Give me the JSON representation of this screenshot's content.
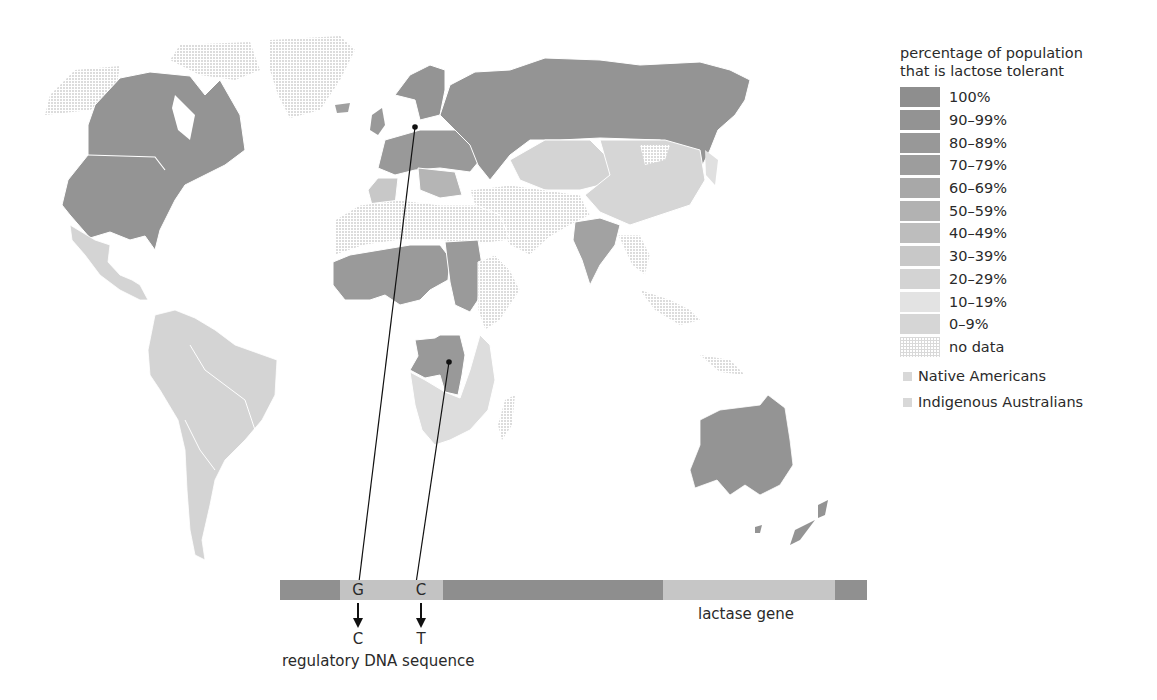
{
  "legend": {
    "title_line1": "percentage of population",
    "title_line2": "that is lactose tolerant",
    "items": [
      {
        "label": "100%",
        "color": "#8e8e8e"
      },
      {
        "label": "90–99%",
        "color": "#939393"
      },
      {
        "label": "80–89%",
        "color": "#989898"
      },
      {
        "label": "70–79%",
        "color": "#9d9d9d"
      },
      {
        "label": "60–69%",
        "color": "#a8a8a8"
      },
      {
        "label": "50–59%",
        "color": "#b2b2b2"
      },
      {
        "label": "40–49%",
        "color": "#bdbdbd"
      },
      {
        "label": "30–39%",
        "color": "#c8c8c8"
      },
      {
        "label": "20–29%",
        "color": "#d3d3d3"
      },
      {
        "label": "10–19%",
        "color": "#e3e3e3"
      },
      {
        "label": "0–9%",
        "color": "#d6d6d6"
      },
      {
        "label": "no data",
        "color": "nodata"
      }
    ],
    "extras": [
      {
        "label": "Native Americans",
        "color": "#d8d8d8"
      },
      {
        "label": "Indigenous Australians",
        "color": "#d8d8d8"
      }
    ]
  },
  "gene": {
    "label": "lactase gene",
    "regulatory_label": "regulatory DNA sequence",
    "mutations": [
      {
        "from": "G",
        "to": "C"
      },
      {
        "from": "C",
        "to": "T"
      }
    ],
    "colors": {
      "dark": "#8f8f8f",
      "light": "#c2c2c2"
    }
  },
  "map": {
    "colors": {
      "high": "#939393",
      "low": "#d4d4d4",
      "lowest": "#e0e0e0",
      "border": "#ffffff"
    },
    "pointers": [
      {
        "region": "Scandinavia",
        "mutation": "G→C"
      },
      {
        "region": "Central Africa",
        "mutation": "C→T"
      }
    ]
  }
}
